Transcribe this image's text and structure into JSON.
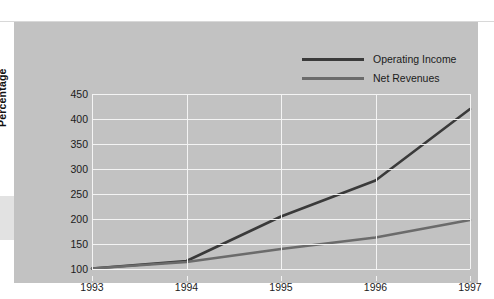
{
  "colors": {
    "page_background": "#ffffff",
    "panel_background": "#c2c2c2",
    "gridline": "#f4f4f4",
    "operating_income": "#3a3a3a",
    "net_revenues": "#6b6b6b",
    "text": "#1b1b1b"
  },
  "axis_title": "Percentage",
  "legend": {
    "items": [
      {
        "label": "Operating Income",
        "color": "#3a3a3a"
      },
      {
        "label": "Net Revenues",
        "color": "#6b6b6b"
      }
    ]
  },
  "chart_data": {
    "type": "line",
    "title": "",
    "subtitle": "",
    "xlabel": "",
    "ylabel": "Percentage",
    "categories": [
      "1993",
      "1994",
      "1995",
      "1996",
      "1997"
    ],
    "x": [
      1993,
      1994,
      1995,
      1996,
      1997
    ],
    "xlim": [
      1993,
      1997
    ],
    "ylim": [
      100,
      450
    ],
    "ytick_labels": [
      "100",
      "150",
      "200",
      "250",
      "300",
      "350",
      "400",
      "450"
    ],
    "yticks": [
      100,
      150,
      200,
      250,
      300,
      350,
      400,
      450
    ],
    "xtick_labels": [
      "1993",
      "1994",
      "1995",
      "1996",
      "1997"
    ],
    "grid": true,
    "legend_position": "top-right",
    "series": [
      {
        "name": "Operating Income",
        "color": "#3a3a3a",
        "values": [
          101,
          116,
          205,
          277,
          420
        ]
      },
      {
        "name": "Net Revenues",
        "color": "#6b6b6b",
        "values": [
          101,
          114,
          140,
          163,
          198
        ]
      }
    ]
  }
}
